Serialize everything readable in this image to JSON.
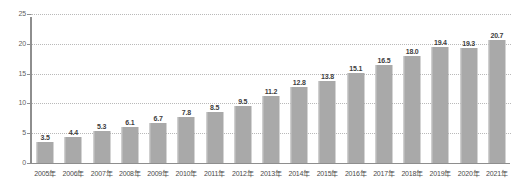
{
  "chart_data": {
    "type": "bar",
    "title": "",
    "subtitle": "",
    "xlabel": "",
    "ylabel": "",
    "categories": [
      "2005年",
      "2006年",
      "2007年",
      "2008年",
      "2009年",
      "2010年",
      "2011年",
      "2012年",
      "2013年",
      "2014年",
      "2015年",
      "2016年",
      "2017年",
      "2018年",
      "2019年",
      "2020年",
      "2021年"
    ],
    "values": [
      3.5,
      4.4,
      5.3,
      6.1,
      6.7,
      7.8,
      8.5,
      9.5,
      11.2,
      12.8,
      13.8,
      15.1,
      16.5,
      18.0,
      19.4,
      19.3,
      20.7
    ],
    "value_labels": [
      "3.5",
      "4.4",
      "5.3",
      "6.1",
      "6.7",
      "7.8",
      "8.5",
      "9.5",
      "11.2",
      "12.8",
      "13.8",
      "15.1",
      "16.5",
      "18.0",
      "19.4",
      "19.3",
      "20.7"
    ],
    "ylim": [
      0,
      25
    ],
    "yticks": [
      0,
      5,
      10,
      15,
      20,
      25
    ],
    "ytick_labels": [
      "0",
      "5",
      "10",
      "15",
      "20",
      "25"
    ],
    "grid": true,
    "grid_style": "dotted",
    "legend": false,
    "legend_position": "none",
    "bar_color": "#a9a9a9",
    "grid_color": "#b9b9b9",
    "axis_color": "#8e8e8e",
    "label_color": "#3d3d3d",
    "tick_color": "#4a4a4a",
    "background": "#ffffff"
  }
}
